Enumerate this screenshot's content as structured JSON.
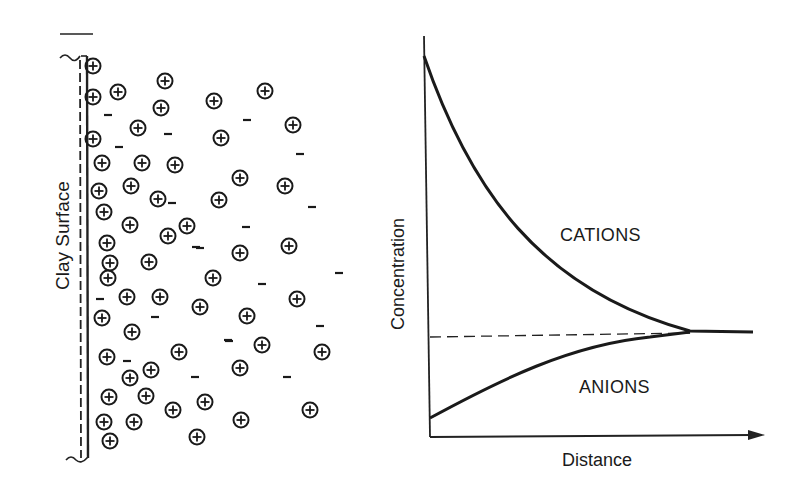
{
  "figure": {
    "left_panel": {
      "title": "",
      "surface_label": "Clay Surface",
      "cation_symbol": "⊕",
      "anion_symbol": "−",
      "cations": [
        [
          93,
          66
        ],
        [
          165,
          81
        ],
        [
          265,
          91
        ],
        [
          93,
          97
        ],
        [
          118,
          92
        ],
        [
          161,
          108
        ],
        [
          214,
          101
        ],
        [
          293,
          125
        ],
        [
          93,
          139
        ],
        [
          138,
          128
        ],
        [
          221,
          138
        ],
        [
          102,
          163
        ],
        [
          142,
          163
        ],
        [
          175,
          165
        ],
        [
          240,
          178
        ],
        [
          285,
          186
        ],
        [
          99,
          191
        ],
        [
          131,
          186
        ],
        [
          158,
          199
        ],
        [
          219,
          200
        ],
        [
          104,
          212
        ],
        [
          130,
          225
        ],
        [
          168,
          236
        ],
        [
          187,
          226
        ],
        [
          107,
          243
        ],
        [
          149,
          262
        ],
        [
          110,
          263
        ],
        [
          240,
          253
        ],
        [
          289,
          246
        ],
        [
          108,
          278
        ],
        [
          213,
          278
        ],
        [
          127,
          297
        ],
        [
          160,
          297
        ],
        [
          200,
          307
        ],
        [
          247,
          316
        ],
        [
          297,
          299
        ],
        [
          102,
          318
        ],
        [
          132,
          332
        ],
        [
          179,
          352
        ],
        [
          262,
          345
        ],
        [
          322,
          352
        ],
        [
          107,
          357
        ],
        [
          240,
          368
        ],
        [
          130,
          378
        ],
        [
          151,
          370
        ],
        [
          109,
          397
        ],
        [
          146,
          396
        ],
        [
          173,
          410
        ],
        [
          205,
          402
        ],
        [
          310,
          410
        ],
        [
          104,
          422
        ],
        [
          134,
          422
        ],
        [
          241,
          420
        ],
        [
          110,
          441
        ],
        [
          197,
          437
        ]
      ],
      "anions": [
        [
          108,
          115
        ],
        [
          168,
          134
        ],
        [
          119,
          147
        ],
        [
          247,
          120
        ],
        [
          300,
          154
        ],
        [
          172,
          203
        ],
        [
          196,
          247
        ],
        [
          246,
          227
        ],
        [
          312,
          207
        ],
        [
          339,
          273
        ],
        [
          200,
          248
        ],
        [
          262,
          284
        ],
        [
          320,
          326
        ],
        [
          100,
          299
        ],
        [
          155,
          317
        ],
        [
          229,
          341
        ],
        [
          127,
          361
        ],
        [
          195,
          377
        ],
        [
          287,
          377
        ],
        [
          228,
          340
        ]
      ]
    },
    "right_panel": {
      "ylabel": "Concentration",
      "xlabel": "Distance",
      "cations_label": "CATIONS",
      "anions_label": "ANIONS"
    }
  },
  "chart_data": {
    "type": "line",
    "title": "",
    "xlabel": "Distance",
    "ylabel": "Concentration",
    "x": [
      0,
      0.1,
      0.2,
      0.3,
      0.4,
      0.5,
      0.6,
      0.7,
      0.8,
      0.9,
      1.0
    ],
    "series": [
      {
        "name": "CATIONS",
        "values": [
          1.0,
          0.74,
          0.54,
          0.4,
          0.3,
          0.23,
          0.18,
          0.15,
          0.13,
          0.12,
          0.12
        ]
      },
      {
        "name": "ANIONS",
        "values": [
          -0.26,
          -0.2,
          -0.14,
          -0.09,
          -0.05,
          -0.02,
          0.0,
          0.005,
          0.01,
          0.012,
          0.012
        ]
      },
      {
        "name": "bulk concentration (dashed)",
        "values": [
          0.0,
          0.0,
          0.0,
          0.0,
          0.0,
          0.0,
          0.0,
          0.0,
          0.0,
          0.0,
          0.0
        ]
      }
    ],
    "annotations": [
      "CATIONS",
      "ANIONS"
    ],
    "grid": false,
    "legend": "none",
    "axis_ticks": "none"
  }
}
